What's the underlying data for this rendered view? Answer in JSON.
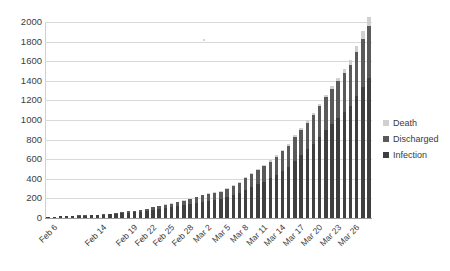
{
  "chart_data": {
    "type": "bar",
    "subtype": "stacked-column",
    "title": "",
    "xlabel": "",
    "ylabel": "",
    "ylim": [
      0,
      2000
    ],
    "ytick_step": 200,
    "yticks": [
      2000,
      1800,
      1600,
      1400,
      1200,
      1000,
      800,
      600,
      400,
      200,
      0
    ],
    "grid": true,
    "grid_axis": "y",
    "legend_position": "right",
    "legend": [
      "Death",
      "Discharged",
      "Infection"
    ],
    "series_colors": {
      "Death": "#d0d0d0",
      "Discharged": "#5a5a5a",
      "Infection": "#3f3f3f"
    },
    "categories": [
      "Feb 6",
      "Feb 7",
      "Feb 8",
      "Feb 9",
      "Feb 10",
      "Feb 11",
      "Feb 12",
      "Feb 13",
      "Feb 14",
      "Feb 15",
      "Feb 16",
      "Feb 17",
      "Feb 18",
      "Feb 19",
      "Feb 20",
      "Feb 21",
      "Feb 22",
      "Feb 23",
      "Feb 24",
      "Feb 25",
      "Feb 26",
      "Feb 27",
      "Feb 28",
      "Feb 29",
      "Mar 1",
      "Mar 2",
      "Mar 3",
      "Mar 4",
      "Mar 5",
      "Mar 6",
      "Mar 7",
      "Mar 8",
      "Mar 9",
      "Mar 10",
      "Mar 11",
      "Mar 12",
      "Mar 13",
      "Mar 14",
      "Mar 15",
      "Mar 16",
      "Mar 17",
      "Mar 18",
      "Mar 19",
      "Mar 20",
      "Mar 21",
      "Mar 22",
      "Mar 23",
      "Mar 24",
      "Mar 25",
      "Mar 26",
      "Mar 27",
      "Mar 28",
      "Mar 29"
    ],
    "visible_xtick_labels": [
      {
        "index": 0,
        "label": "Feb 6"
      },
      {
        "index": 8,
        "label": "Feb 14"
      },
      {
        "index": 13,
        "label": "Feb 19"
      },
      {
        "index": 16,
        "label": "Feb 22"
      },
      {
        "index": 19,
        "label": "Feb 25"
      },
      {
        "index": 22,
        "label": "Feb 28"
      },
      {
        "index": 25,
        "label": "Mar 2"
      },
      {
        "index": 28,
        "label": "Mar 5"
      },
      {
        "index": 31,
        "label": "Mar 8"
      },
      {
        "index": 34,
        "label": "Mar 11"
      },
      {
        "index": 37,
        "label": "Mar 14"
      },
      {
        "index": 40,
        "label": "Mar 17"
      },
      {
        "index": 43,
        "label": "Mar 20"
      },
      {
        "index": 46,
        "label": "Mar 23"
      },
      {
        "index": 49,
        "label": "Mar 26"
      }
    ],
    "series": [
      {
        "name": "Infection",
        "values": [
          11,
          13,
          16,
          18,
          20,
          23,
          25,
          28,
          30,
          34,
          38,
          44,
          50,
          56,
          60,
          66,
          74,
          84,
          92,
          104,
          112,
          120,
          132,
          142,
          155,
          168,
          178,
          186,
          196,
          212,
          232,
          252,
          288,
          320,
          348,
          372,
          404,
          440,
          480,
          520,
          585,
          640,
          700,
          760,
          830,
          900,
          960,
          1020,
          1080,
          1140,
          1240,
          1340,
          1430
        ]
      },
      {
        "name": "Discharged",
        "values": [
          1,
          1,
          2,
          2,
          3,
          3,
          4,
          4,
          5,
          6,
          7,
          8,
          10,
          12,
          14,
          16,
          20,
          24,
          28,
          32,
          36,
          42,
          46,
          52,
          56,
          62,
          66,
          70,
          74,
          84,
          92,
          105,
          120,
          130,
          142,
          155,
          170,
          185,
          200,
          215,
          240,
          255,
          272,
          290,
          310,
          330,
          352,
          375,
          395,
          420,
          455,
          490,
          530
        ]
      },
      {
        "name": "Death",
        "values": [
          0,
          0,
          0,
          0,
          0,
          0,
          0,
          0,
          0,
          0,
          0,
          1,
          1,
          1,
          1,
          2,
          2,
          2,
          3,
          3,
          4,
          4,
          5,
          5,
          6,
          7,
          7,
          8,
          8,
          9,
          10,
          11,
          12,
          13,
          14,
          15,
          16,
          17,
          18,
          19,
          21,
          22,
          24,
          26,
          28,
          30,
          34,
          38,
          42,
          48,
          60,
          75,
          95
        ]
      }
    ],
    "totals": [
      12,
      14,
      18,
      20,
      23,
      26,
      29,
      32,
      35,
      40,
      45,
      53,
      61,
      69,
      75,
      84,
      96,
      110,
      123,
      139,
      152,
      166,
      183,
      199,
      217,
      237,
      251,
      264,
      278,
      305,
      334,
      368,
      420,
      463,
      504,
      542,
      590,
      642,
      698,
      754,
      846,
      917,
      996,
      1076,
      1168,
      1260,
      1346,
      1433,
      1517,
      1608,
      1755,
      1905,
      2055
    ]
  }
}
